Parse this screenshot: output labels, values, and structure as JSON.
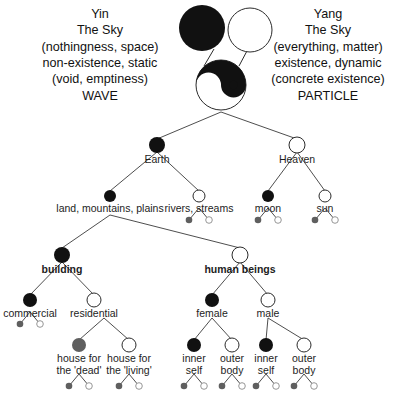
{
  "diagram": {
    "colors": {
      "black": "#111111",
      "white": "#ffffff",
      "gray": "#5f5f5f",
      "stroke": "#2b2b2b",
      "line": "#3a3a3a",
      "text": "#1d1d1d"
    },
    "left_block": {
      "lines": [
        "Yin",
        "The Sky",
        "(nothingness, space)",
        "non-existence, static",
        "(void, emptiness)",
        "WAVE"
      ]
    },
    "right_block": {
      "lines": [
        "Yang",
        "The Sky",
        "(everything, matter)",
        "existence, dynamic",
        "(concrete existence)",
        "PARTICLE"
      ]
    },
    "symbol": {
      "name": "yin-yang-symbol",
      "top_black_circle": "yin-black-circle",
      "top_white_circle": "yang-white-circle"
    },
    "nodes": [
      {
        "id": "earth",
        "label": "Earth",
        "fill": "black",
        "bold": false,
        "cx": 157,
        "cy": 145,
        "r": 8,
        "label_y": 154
      },
      {
        "id": "heaven",
        "label": "Heaven",
        "fill": "white",
        "bold": false,
        "cx": 297,
        "cy": 145,
        "r": 8,
        "label_y": 154
      },
      {
        "id": "land",
        "label": "land, mountains, plains",
        "fill": "black",
        "bold": false,
        "cx": 110,
        "cy": 196,
        "r": 6,
        "label_y": 203
      },
      {
        "id": "rivers",
        "label": "rivers, streams",
        "fill": "white",
        "bold": false,
        "cx": 199,
        "cy": 196,
        "r": 6,
        "label_y": 203
      },
      {
        "id": "moon",
        "label": "moon",
        "fill": "black",
        "bold": false,
        "cx": 268,
        "cy": 196,
        "r": 6,
        "label_y": 203
      },
      {
        "id": "sun",
        "label": "sun",
        "fill": "white",
        "bold": false,
        "cx": 325,
        "cy": 196,
        "r": 6,
        "label_y": 203
      },
      {
        "id": "building",
        "label": "building",
        "fill": "black",
        "bold": true,
        "cx": 62,
        "cy": 255,
        "r": 8,
        "label_y": 264
      },
      {
        "id": "human-beings",
        "label": "human beings",
        "fill": "white",
        "bold": true,
        "cx": 240,
        "cy": 255,
        "r": 8,
        "label_y": 264
      },
      {
        "id": "commercial",
        "label": "commercial",
        "fill": "black",
        "bold": false,
        "cx": 30,
        "cy": 300,
        "r": 7,
        "label_y": 308
      },
      {
        "id": "residential",
        "label": "residential",
        "fill": "white",
        "bold": false,
        "cx": 94,
        "cy": 300,
        "r": 7,
        "label_y": 308
      },
      {
        "id": "female",
        "label": "female",
        "fill": "black",
        "bold": false,
        "cx": 212,
        "cy": 300,
        "r": 7,
        "label_y": 308
      },
      {
        "id": "male",
        "label": "male",
        "fill": "white",
        "bold": false,
        "cx": 268,
        "cy": 300,
        "r": 7,
        "label_y": 308
      },
      {
        "id": "house-dead",
        "label": "house for\nthe 'dead'",
        "fill": "gray",
        "bold": false,
        "cx": 79,
        "cy": 345,
        "r": 7,
        "label_y": 353
      },
      {
        "id": "house-living",
        "label": "house for\nthe 'living'",
        "fill": "white",
        "bold": false,
        "cx": 129,
        "cy": 345,
        "r": 7,
        "label_y": 353
      },
      {
        "id": "female-inner",
        "label": "inner\nself",
        "fill": "black",
        "bold": false,
        "cx": 194,
        "cy": 345,
        "r": 7,
        "label_y": 353
      },
      {
        "id": "female-outer",
        "label": "outer\nbody",
        "fill": "white",
        "bold": false,
        "cx": 232,
        "cy": 345,
        "r": 7,
        "label_y": 353
      },
      {
        "id": "male-inner",
        "label": "inner\nself",
        "fill": "black",
        "bold": false,
        "cx": 266,
        "cy": 345,
        "r": 7,
        "label_y": 353
      },
      {
        "id": "male-outer",
        "label": "outer\nbody",
        "fill": "white",
        "bold": false,
        "cx": 304,
        "cy": 345,
        "r": 7,
        "label_y": 353
      }
    ],
    "leaf_pairs": [
      {
        "id": "rivers-leaves",
        "cx": 199,
        "cy": 220,
        "dx": 10,
        "dy": 12
      },
      {
        "id": "moon-leaves",
        "cx": 268,
        "cy": 220,
        "dx": 10,
        "dy": 12
      },
      {
        "id": "sun-leaves",
        "cx": 325,
        "cy": 220,
        "dx": 10,
        "dy": 12
      },
      {
        "id": "commercial-leaves",
        "cx": 30,
        "cy": 324,
        "dx": 10,
        "dy": 12
      },
      {
        "id": "house-dead-leaves",
        "cx": 79,
        "cy": 386,
        "dx": 10,
        "dy": 12
      },
      {
        "id": "house-living-leaves",
        "cx": 129,
        "cy": 386,
        "dx": 10,
        "dy": 12
      },
      {
        "id": "female-inner-leaves",
        "cx": 194,
        "cy": 386,
        "dx": 10,
        "dy": 12
      },
      {
        "id": "female-outer-leaves",
        "cx": 232,
        "cy": 386,
        "dx": 10,
        "dy": 12
      },
      {
        "id": "male-inner-leaves",
        "cx": 266,
        "cy": 386,
        "dx": 10,
        "dy": 12
      },
      {
        "id": "male-outer-leaves",
        "cx": 304,
        "cy": 386,
        "dx": 10,
        "dy": 12
      }
    ],
    "edges": [
      {
        "id": "symbol-to-earth",
        "x1": 221,
        "y1": 112,
        "x2": 157,
        "y2": 139
      },
      {
        "id": "symbol-to-heaven",
        "x1": 221,
        "y1": 112,
        "x2": 297,
        "y2": 139
      },
      {
        "id": "earth-to-land",
        "x1": 157,
        "y1": 152,
        "x2": 110,
        "y2": 191
      },
      {
        "id": "earth-to-rivers",
        "x1": 157,
        "y1": 152,
        "x2": 199,
        "y2": 191
      },
      {
        "id": "heaven-to-moon",
        "x1": 297,
        "y1": 152,
        "x2": 268,
        "y2": 191
      },
      {
        "id": "heaven-to-sun",
        "x1": 297,
        "y1": 152,
        "x2": 325,
        "y2": 191
      },
      {
        "id": "land-to-building",
        "x1": 110,
        "y1": 215,
        "x2": 62,
        "y2": 248
      },
      {
        "id": "land-to-human-beings",
        "x1": 110,
        "y1": 215,
        "x2": 240,
        "y2": 248
      },
      {
        "id": "building-to-commercial",
        "x1": 62,
        "y1": 262,
        "x2": 30,
        "y2": 295
      },
      {
        "id": "building-to-residential",
        "x1": 62,
        "y1": 262,
        "x2": 94,
        "y2": 295
      },
      {
        "id": "human-to-female",
        "x1": 240,
        "y1": 262,
        "x2": 212,
        "y2": 295
      },
      {
        "id": "human-to-male",
        "x1": 240,
        "y1": 262,
        "x2": 268,
        "y2": 295
      },
      {
        "id": "residential-to-dead",
        "x1": 104,
        "y1": 318,
        "x2": 79,
        "y2": 340
      },
      {
        "id": "residential-to-living",
        "x1": 104,
        "y1": 318,
        "x2": 129,
        "y2": 340
      },
      {
        "id": "female-to-inner",
        "x1": 212,
        "y1": 318,
        "x2": 194,
        "y2": 340
      },
      {
        "id": "female-to-outer",
        "x1": 212,
        "y1": 318,
        "x2": 232,
        "y2": 340
      },
      {
        "id": "male-to-inner",
        "x1": 268,
        "y1": 318,
        "x2": 266,
        "y2": 340
      },
      {
        "id": "male-to-outer",
        "x1": 268,
        "y1": 318,
        "x2": 304,
        "y2": 340
      }
    ]
  }
}
